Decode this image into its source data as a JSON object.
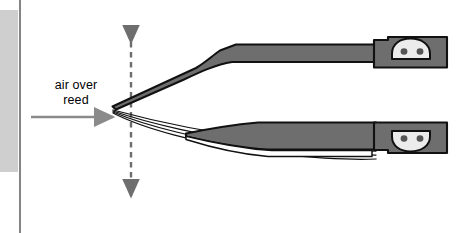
{
  "figure": {
    "kind": "technical-diagram",
    "background_color": "#ffffff",
    "annotation": {
      "flow_label_line1": "air over",
      "flow_label_line2": "reed",
      "flow_arrow_direction": "right",
      "flow_arrow_color": "#8a8a8a",
      "vibration_arrow_direction": "up-down",
      "vibration_arrow_style": "dashed",
      "vibration_arrow_color": "#6e6e6e"
    },
    "parts": {
      "reed_fill": "#6e6e6e",
      "reed_outline": "#111111",
      "clamp_fill": "#6e6e6e",
      "clamp_dome_fill": "#ececec",
      "rivet_fill": "#555555",
      "rivet_count": 2,
      "upper_reed_label": "upper-reed-blade",
      "lower_reed_label": "lower-reed-blade",
      "vibration_trace_count": 4
    },
    "margin_block": {
      "color": "#cfcfcf",
      "rule_color": "#848484"
    }
  }
}
